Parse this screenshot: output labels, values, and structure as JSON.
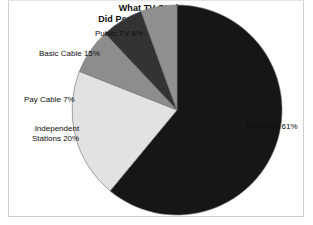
{
  "figure": {
    "width": 313,
    "height": 225,
    "background": "#ffffff",
    "frame_color": "#cfcfcf"
  },
  "title": {
    "line1": "What TV Stations",
    "line2": "Did People Watch in 1988?"
  },
  "labels": {
    "public_tv": "Public TV 4%",
    "basic_cable": "Basic Cable 15%",
    "pay_cable": "Pay Cable 7%",
    "independent_line1": "Independent",
    "independent_line2": "Stations 20%",
    "networks": "Networks 61%"
  },
  "chart_data": {
    "type": "pie",
    "title": "What TV Stations Did People Watch in 1988?",
    "xlabel": "",
    "ylabel": "",
    "units": "percent",
    "total": 107,
    "start_angle_deg": 0,
    "direction": "clockwise",
    "legend": "none-labels-outside",
    "grid": false,
    "center": {
      "x": 177,
      "y": 110
    },
    "radius": 105,
    "categories": [
      "Networks",
      "Independent Stations",
      "Basic Cable",
      "Pay Cable",
      "Public TV"
    ],
    "values": [
      61,
      20,
      15,
      7,
      4
    ],
    "slices": [
      {
        "name": "Networks",
        "label": "Networks 61%",
        "value": 61,
        "color": "#161616",
        "start_deg": 0,
        "end_deg": 219.6,
        "label_side": "right"
      },
      {
        "name": "Independent Stations",
        "label": "Stations 20%",
        "value": 20,
        "color": "#e2e2e2",
        "start_deg": 219.6,
        "end_deg": 291.6,
        "label_side": "left"
      },
      {
        "name": "Pay Cable",
        "label": "Pay Cable 7%",
        "value": 7,
        "color": "#8d8d8d",
        "start_deg": 291.6,
        "end_deg": 316.8,
        "label_side": "left"
      },
      {
        "name": "Basic Cable",
        "label": "Basic Cable 15%",
        "value": 15,
        "color": "#333333",
        "start_deg": 316.8,
        "end_deg": 340.0,
        "label_side": "left"
      },
      {
        "name": "Public TV",
        "label": "Public TV 4%",
        "value": 4,
        "color": "#909090",
        "start_deg": 340.0,
        "end_deg": 360.0,
        "label_side": "top"
      }
    ],
    "colors": {
      "networks": "#161616",
      "independent_stations": "#e2e2e2",
      "pay_cable": "#8d8d8d",
      "basic_cable": "#333333",
      "public_tv": "#909090",
      "outline": "#6e6e6e"
    }
  }
}
